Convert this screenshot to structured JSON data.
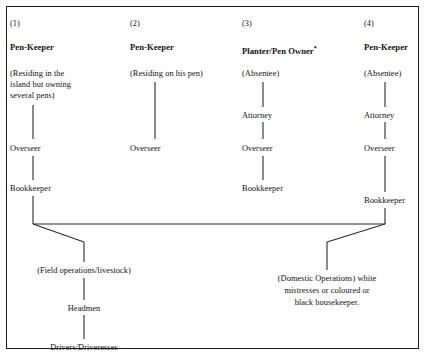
{
  "figure": {
    "type": "hierarchy-diagram",
    "background": "#ffffff",
    "line_color": "#1a1a1a",
    "border_color": "#1a1a1a"
  },
  "columns": [
    {
      "number": "(1)",
      "role": "Pen-Keeper",
      "note_lines": [
        "(Residing in the",
        "island but owning",
        "several pens)"
      ],
      "chain": [
        "Overseer",
        "Bookkeeper"
      ]
    },
    {
      "number": "(2)",
      "role": "Pen-Keeper",
      "note_lines": [
        "(Residing on his pen)"
      ],
      "chain": [
        "Overseer"
      ]
    },
    {
      "number": "(3)",
      "role": "Planter/Pen Owner",
      "role_footnote": "*",
      "note_lines": [
        "(Absentee)"
      ],
      "chain": [
        "Attorney",
        "Overseer",
        "Bookkeeper"
      ]
    },
    {
      "number": "(4)",
      "role": "Pen-Keeper",
      "note_lines": [
        "(Absentee)"
      ],
      "chain": [
        "Attorney",
        "Overseer",
        "Bookkeeper"
      ]
    }
  ],
  "branches": {
    "left": {
      "heading": "(Field operations/livestock)",
      "chain": [
        "Headmen",
        "Drivers/Driveresses"
      ]
    },
    "right": {
      "lines": [
        "(Domestic Operations) white",
        "mistresses or coloured or",
        "black housekeeper."
      ]
    }
  }
}
